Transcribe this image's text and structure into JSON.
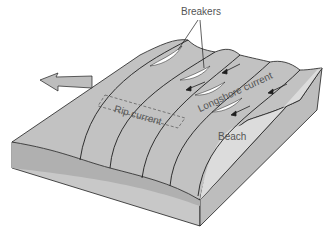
{
  "labels": {
    "breakers": "Breakers",
    "rip_current": "Rip current",
    "longshore_current": "Longshore current",
    "beach": "Beach"
  },
  "colors": {
    "water": "#c2c2c2",
    "water_dark": "#adadad",
    "beach": "#dcdcdc",
    "block_front": "#c8c8c8",
    "block_side": "#bdbdbd",
    "outline": "#1e1e1e",
    "foam": "#ffffff",
    "label_text": "#555555"
  }
}
